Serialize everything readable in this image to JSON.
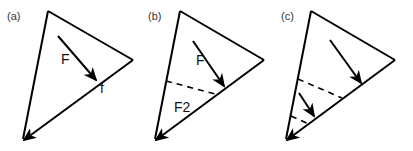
{
  "panels": [
    {
      "id": "a",
      "label": "(a)",
      "force_label": "F",
      "edge_label": "f"
    },
    {
      "id": "b",
      "label": "(b)",
      "force_label": "F",
      "region_label": "F2"
    },
    {
      "id": "c",
      "label": "(c)"
    }
  ],
  "colors": {
    "stroke": "#000000",
    "background": "#ffffff"
  }
}
